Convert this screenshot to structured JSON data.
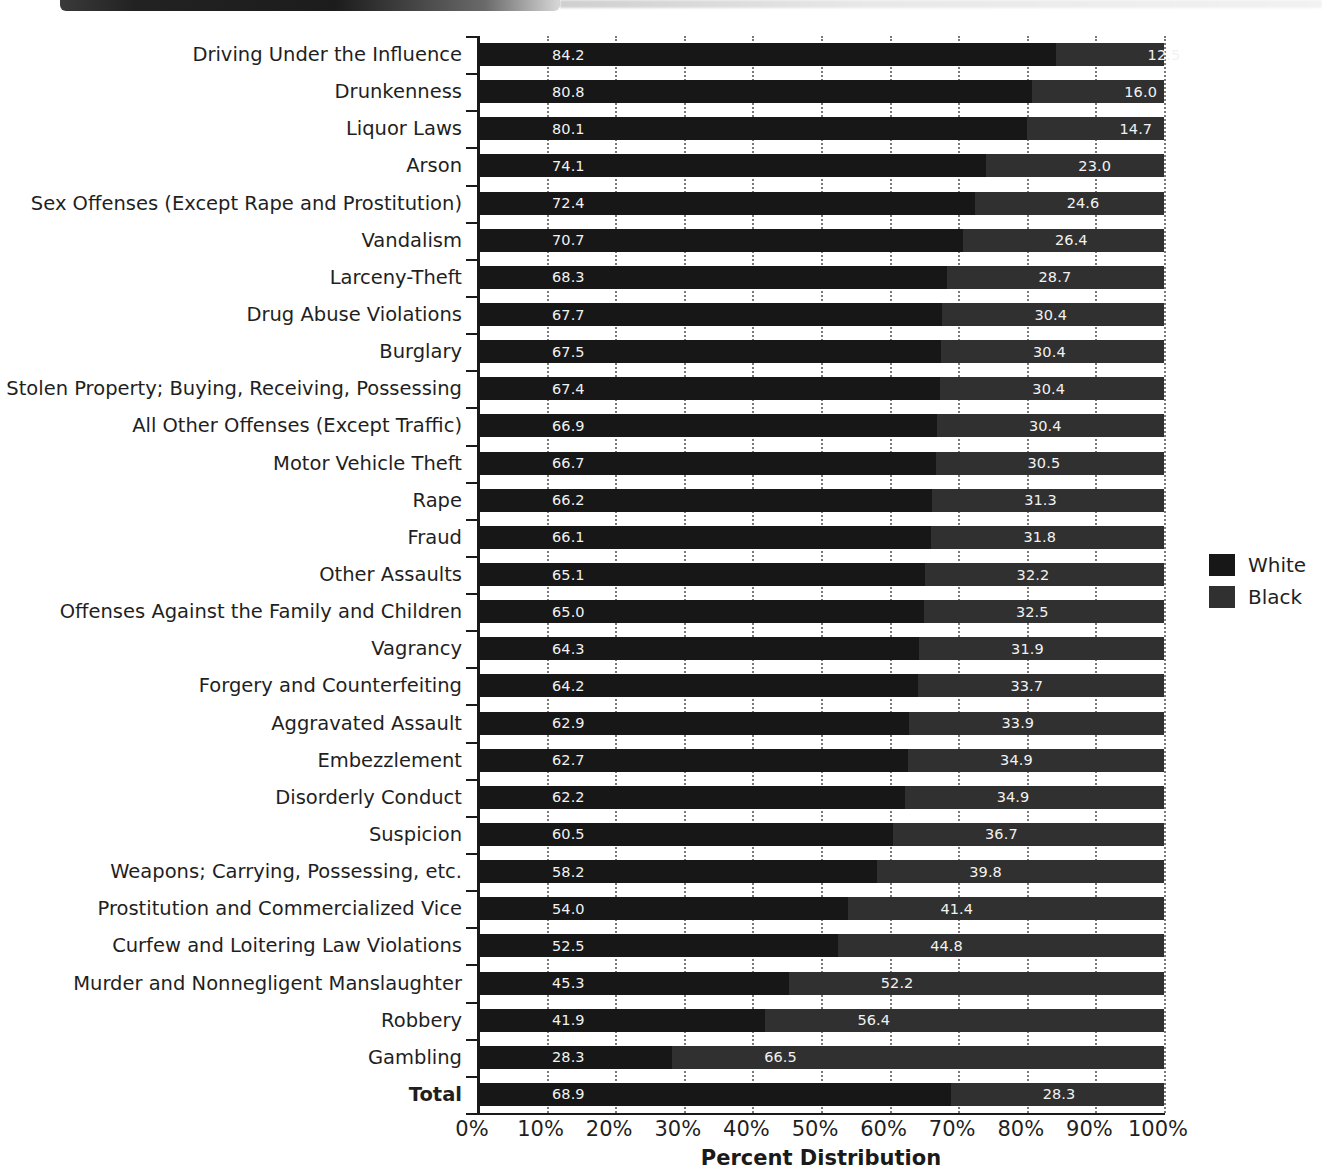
{
  "chart_data": {
    "type": "bar",
    "subtype": "horizontal-stacked-bar",
    "title": "",
    "xlabel": "Percent Distribution",
    "ylabel": "",
    "xlim": [
      0,
      100
    ],
    "xticks": [
      "0%",
      "10%",
      "20%",
      "30%",
      "40%",
      "50%",
      "60%",
      "70%",
      "80%",
      "90%",
      "100%"
    ],
    "xtick_values": [
      0,
      10,
      20,
      30,
      40,
      50,
      60,
      70,
      80,
      90,
      100
    ],
    "grid": "vertical-dotted",
    "legend_position": "right",
    "legend": [
      "White",
      "Black"
    ],
    "categories": [
      "Driving Under the Influence",
      "Drunkenness",
      "Liquor Laws",
      "Arson",
      "Sex Offenses (Except Rape and Prostitution)",
      "Vandalism",
      "Larceny-Theft",
      "Drug Abuse Violations",
      "Burglary",
      "Stolen Property; Buying, Receiving, Possessing",
      "All Other Offenses (Except Traffic)",
      "Motor Vehicle Theft",
      "Rape",
      "Fraud",
      "Other Assaults",
      "Offenses Against the Family and Children",
      "Vagrancy",
      "Forgery and Counterfeiting",
      "Aggravated Assault",
      "Embezzlement",
      "Disorderly Conduct",
      "Suspicion",
      "Weapons; Carrying, Possessing, etc.",
      "Prostitution and Commercialized Vice",
      "Curfew and Loitering Law Violations",
      "Murder and Nonnegligent Manslaughter",
      "Robbery",
      "Gambling",
      "Total"
    ],
    "series": [
      {
        "name": "White",
        "values": [
          84.2,
          80.8,
          80.1,
          74.1,
          72.4,
          70.7,
          68.3,
          67.7,
          67.5,
          67.4,
          66.9,
          66.7,
          66.2,
          66.1,
          65.1,
          65.0,
          64.3,
          64.2,
          62.9,
          62.7,
          62.2,
          60.5,
          58.2,
          54.0,
          52.5,
          45.3,
          41.9,
          28.3,
          68.9
        ]
      },
      {
        "name": "Black",
        "values": [
          12.5,
          16.0,
          14.7,
          23.0,
          24.6,
          26.4,
          28.7,
          30.4,
          30.4,
          30.4,
          30.4,
          30.5,
          31.3,
          31.8,
          32.2,
          32.5,
          31.9,
          33.7,
          33.9,
          34.9,
          34.9,
          36.7,
          39.8,
          41.4,
          44.8,
          52.2,
          56.4,
          66.5,
          28.3
        ]
      }
    ],
    "colors": {
      "white_series": "#171717",
      "black_series": "#303030",
      "background": "#ffffff",
      "axis": "#1a1a1a",
      "gridline": "#7a7a7a",
      "bar_label_text": "#f2f2f2"
    }
  }
}
